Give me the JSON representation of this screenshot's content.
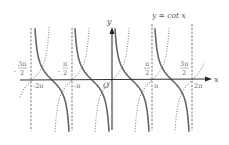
{
  "chart_data": {
    "type": "line",
    "title": "y = cot x",
    "xlabel": "x",
    "ylabel": "y",
    "origin_label": "O",
    "xlim": [
      "-5π/2",
      "5π/2"
    ],
    "ylim": [
      -4,
      4
    ],
    "grid": false,
    "legend": "none (inline label at top right)",
    "series": [
      {
        "name": "y = cot x",
        "style": "solid",
        "color": "#6a6a6a",
        "function": "cot(x)",
        "asymptotes": [
          "-2π",
          "-π",
          "0",
          "π",
          "2π"
        ],
        "zeros": [
          "-3π/2",
          "-π/2",
          "π/2",
          "3π/2"
        ]
      },
      {
        "name": "y = tan x",
        "style": "dotted",
        "color": "#8a8a8a",
        "function": "tan(x)",
        "zeros": [
          "-2π",
          "-π",
          "0",
          "π",
          "2π"
        ]
      }
    ],
    "vertical_asymptote_lines": {
      "style": "dashed",
      "positions": [
        "-2π",
        "-π",
        "0",
        "π",
        "2π"
      ]
    },
    "x_tick_labels_below": [
      "-2π",
      "-π",
      "π",
      "2π"
    ],
    "x_tick_labels_above": [
      {
        "num": "3π",
        "den": "2",
        "sign": "-"
      },
      {
        "num": "π",
        "den": "2",
        "sign": "-"
      },
      {
        "num": "π",
        "den": "2",
        "sign": ""
      },
      {
        "num": "3π",
        "den": "2",
        "sign": ""
      }
    ]
  },
  "labels": {
    "curve_label": "y = cot x",
    "x_axis": "x",
    "y_axis": "y",
    "origin": "O",
    "tick_m2pi": "-2π",
    "tick_mpi": "-π",
    "tick_pi": "π",
    "tick_2pi": "2π",
    "frac_m3pi2_num": "3π",
    "frac_mpi2_num": "π",
    "frac_pi2_num": "π",
    "frac_3pi2_num": "3π",
    "den": "2",
    "minus": "-"
  }
}
